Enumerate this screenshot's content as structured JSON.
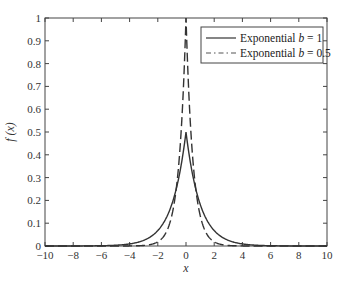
{
  "chart_data": {
    "type": "line",
    "title": "",
    "xlabel": "x",
    "ylabel": "f (x)",
    "xlim": [
      -10,
      10
    ],
    "ylim": [
      0,
      1
    ],
    "xticks": [
      -10,
      -8,
      -6,
      -4,
      -2,
      0,
      2,
      4,
      6,
      8,
      10
    ],
    "yticks": [
      0,
      0.1,
      0.2,
      0.3,
      0.4,
      0.5,
      0.6,
      0.7,
      0.8,
      0.9,
      1
    ],
    "xtick_labels": [
      "−10",
      "−8",
      "−6",
      "−4",
      "−2",
      "0",
      "2",
      "4",
      "6",
      "8",
      "10"
    ],
    "ytick_labels": [
      "0",
      "0.1",
      "0.2",
      "0.3",
      "0.4",
      "0.5",
      "0.6",
      "0.7",
      "0.8",
      "0.9",
      "1"
    ],
    "grid": false,
    "legend_position": "upper right",
    "series": [
      {
        "name": "Exponential b = 1",
        "legend_prefix": "Exponential ",
        "legend_param": "b",
        "legend_suffix": " = 1",
        "style": "solid",
        "color": "#333333",
        "b": 1,
        "peak": 0.5,
        "x": [
          -10,
          -6,
          -4,
          -3,
          -2,
          -1.5,
          -1,
          -0.5,
          -0.25,
          0,
          0.25,
          0.5,
          1,
          1.5,
          2,
          3,
          4,
          6,
          10
        ],
        "values": [
          2.27e-05,
          0.00124,
          0.00916,
          0.0249,
          0.0677,
          0.1116,
          0.1839,
          0.3033,
          0.3894,
          0.5,
          0.3894,
          0.3033,
          0.1839,
          0.1116,
          0.0677,
          0.0249,
          0.00916,
          0.00124,
          2.27e-05
        ]
      },
      {
        "name": "Exponential b = 0.5",
        "legend_prefix": "Exponential ",
        "legend_param": "b",
        "legend_suffix": " = 0.5",
        "style": "dashed",
        "color": "#333333",
        "b": 0.5,
        "peak": 1.0,
        "x": [
          -10,
          -4,
          -3,
          -2,
          -1.5,
          -1,
          -0.75,
          -0.5,
          -0.25,
          0,
          0.25,
          0.5,
          0.75,
          1,
          1.5,
          2,
          3,
          4,
          10
        ],
        "values": [
          0.0,
          0.000335,
          0.00248,
          0.0183,
          0.0498,
          0.1353,
          0.2231,
          0.3679,
          0.6065,
          1.0,
          0.6065,
          0.3679,
          0.2231,
          0.1353,
          0.0498,
          0.0183,
          0.00248,
          0.000335,
          0.0
        ]
      }
    ]
  }
}
